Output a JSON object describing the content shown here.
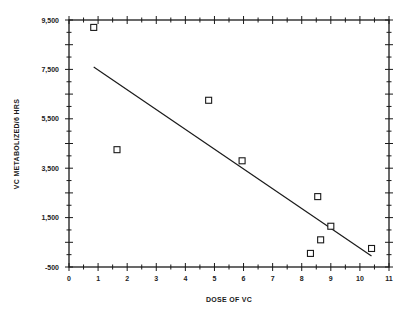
{
  "chart_data": {
    "type": "scatter",
    "title": "",
    "xlabel": "DOSE OF VC",
    "ylabel": "VC METABOLIZED/6 HRS",
    "xlim": [
      0,
      11
    ],
    "ylim": [
      -500,
      9500
    ],
    "x_ticks": [
      "0",
      "1",
      "2",
      "3",
      "4",
      "5",
      "6",
      "7",
      "8",
      "9",
      "10",
      "11"
    ],
    "y_ticks": [
      "9,500",
      "7,500",
      "5,500",
      "3,500",
      "1,500",
      "-500"
    ],
    "grid": false,
    "legend": null,
    "series": [
      {
        "name": "observations",
        "marker": "open-square",
        "points": [
          {
            "x": 0.85,
            "y": 9200
          },
          {
            "x": 1.65,
            "y": 4250
          },
          {
            "x": 4.8,
            "y": 6250
          },
          {
            "x": 5.95,
            "y": 3800
          },
          {
            "x": 8.55,
            "y": 2350
          },
          {
            "x": 9.0,
            "y": 1150
          },
          {
            "x": 8.65,
            "y": 600
          },
          {
            "x": 8.3,
            "y": 50
          },
          {
            "x": 10.4,
            "y": 250
          }
        ]
      },
      {
        "name": "regression line",
        "type": "line",
        "points": [
          {
            "x": 0.85,
            "y": 7600
          },
          {
            "x": 10.4,
            "y": -50
          }
        ]
      }
    ]
  }
}
